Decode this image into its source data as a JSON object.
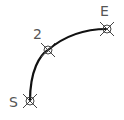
{
  "diagram": {
    "type": "arc-path",
    "colors": {
      "arc": "#111111",
      "marker": "#333333",
      "label": "#555555"
    },
    "points": [
      {
        "id": "start",
        "label": "S",
        "x": 30,
        "y": 101
      },
      {
        "id": "mid",
        "label": "2",
        "x": 48,
        "y": 50
      },
      {
        "id": "end",
        "label": "E",
        "x": 107,
        "y": 29
      }
    ]
  }
}
